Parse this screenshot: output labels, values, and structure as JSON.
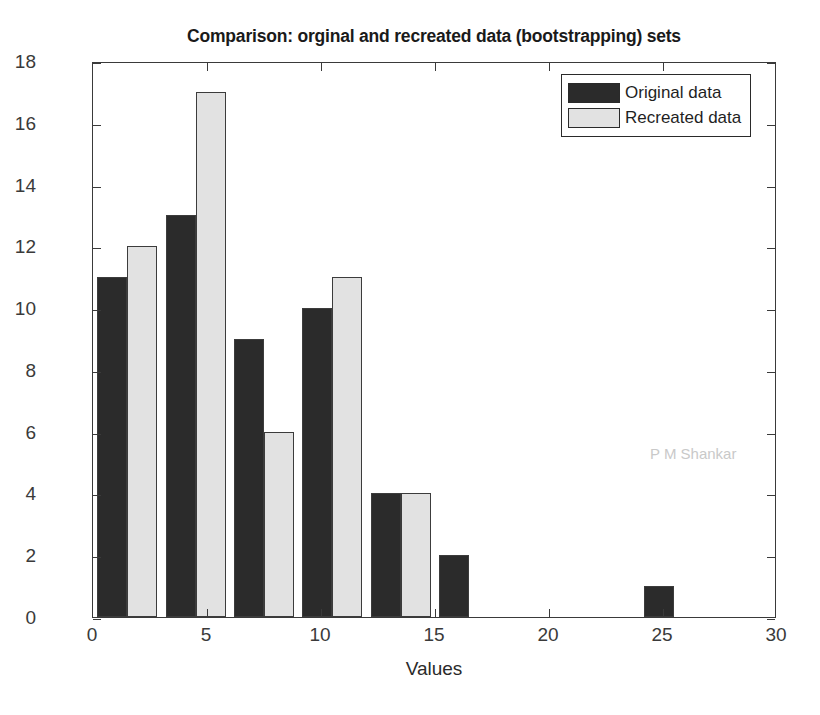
{
  "chart_data": {
    "type": "bar",
    "title": "Comparison: orginal and recreated data (bootstrapping) sets",
    "xlabel": "Values",
    "ylabel": "Frequency",
    "xlim": [
      0,
      30
    ],
    "ylim": [
      0,
      18
    ],
    "xticks": [
      0,
      5,
      10,
      15,
      20,
      25,
      30
    ],
    "yticks": [
      0,
      2,
      4,
      6,
      8,
      10,
      12,
      14,
      16,
      18
    ],
    "grid": false,
    "legend_position": "top-right",
    "bin_centers": [
      1.5,
      4.5,
      7.5,
      10.5,
      13.5,
      16.5,
      19.5,
      22.5,
      25.5
    ],
    "series": [
      {
        "name": "Original data",
        "color": "#2b2b2b",
        "values": [
          11,
          13,
          9,
          10,
          4,
          2,
          0,
          0,
          1
        ]
      },
      {
        "name": "Recreated data",
        "color": "#e2e2e2",
        "values": [
          12,
          17,
          6,
          11,
          4,
          0,
          0,
          0,
          0
        ]
      }
    ],
    "annotations": [
      {
        "text": "P M Shankar",
        "color": "#c9c9c9"
      }
    ]
  },
  "legend": {
    "entries": [
      {
        "label": "Original data"
      },
      {
        "label": "Recreated data"
      }
    ]
  },
  "watermark": {
    "text": "P M Shankar"
  }
}
